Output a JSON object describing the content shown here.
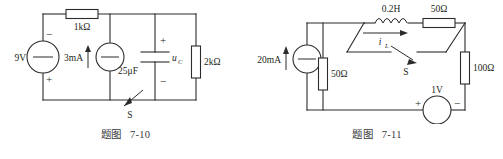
{
  "document": {
    "type": "textbook-circuit-figures",
    "figure_count": 2,
    "background_color": "#ffffff",
    "ink_color": "#231f20"
  },
  "figures": [
    {
      "id": "7-10",
      "caption": "题图   7-10",
      "components": {
        "voltage_source": {
          "label": "9V",
          "plus": "+",
          "minus": "−"
        },
        "resistor_top": {
          "label": "1kΩ"
        },
        "current_source": {
          "label": "3mA"
        },
        "capacitor": {
          "label": "25μF",
          "voltage_label": "u",
          "voltage_sub": "C",
          "plus": "+",
          "minus": "−"
        },
        "resistor_right": {
          "label": "2kΩ"
        },
        "switch": {
          "label": "S"
        }
      }
    },
    {
      "id": "7-11",
      "caption": "题图   7-11",
      "components": {
        "current_source": {
          "label": "20mA"
        },
        "inductor": {
          "label": "0.2H",
          "current_label": "i",
          "current_sub": "L"
        },
        "resistor_top_right": {
          "label": "50Ω"
        },
        "resistor_middle": {
          "label": "50Ω"
        },
        "resistor_right": {
          "label": "100Ω"
        },
        "voltage_source": {
          "label": "1V",
          "plus": "+",
          "minus": "−"
        },
        "switch": {
          "label": "S"
        }
      }
    }
  ]
}
